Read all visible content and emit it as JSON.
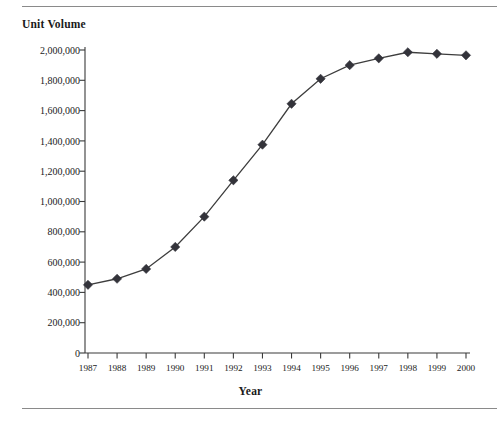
{
  "figure": {
    "title": "Unit Volume",
    "x_axis_title": "Year",
    "rules": {
      "top": "divider-line",
      "bottom": "divider-line"
    }
  },
  "chart_data": {
    "type": "line",
    "title": "Unit Volume",
    "xlabel": "Year",
    "ylabel": "Unit Volume",
    "grid": false,
    "legend": "none",
    "marker": "diamond",
    "line_color": "#3d3d3d",
    "marker_color": "#33333a",
    "xlim": [
      1987,
      2000
    ],
    "ylim": [
      0,
      2000000
    ],
    "categories": [
      "1987",
      "1988",
      "1989",
      "1990",
      "1991",
      "1992",
      "1993",
      "1994",
      "1995",
      "1996",
      "1997",
      "1998",
      "1999",
      "2000"
    ],
    "values": [
      450000,
      490000,
      555000,
      700000,
      900000,
      1140000,
      1375000,
      1645000,
      1810000,
      1900000,
      1945000,
      1985000,
      1975000,
      1965000
    ],
    "ytick_labels": [
      "2,000,000",
      "1,800,000",
      "1,600,000",
      "1,400,000",
      "1,200,000",
      "1,000,000",
      "800,000",
      "600,000",
      "400,000",
      "200,000",
      "0"
    ],
    "ytick_values": [
      2000000,
      1800000,
      1600000,
      1400000,
      1200000,
      1000000,
      800000,
      600000,
      400000,
      200000,
      0
    ],
    "xtick_labels": [
      "1987",
      "1988",
      "1989",
      "1990",
      "1991",
      "1992",
      "1993",
      "1994",
      "1995",
      "1996",
      "1997",
      "1998",
      "1999",
      "2000"
    ]
  }
}
